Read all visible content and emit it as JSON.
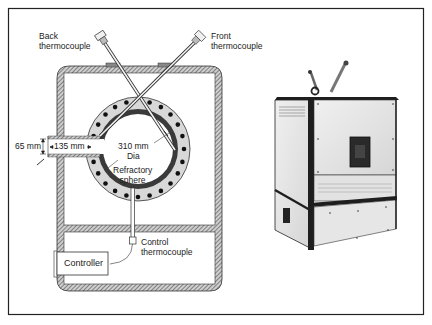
{
  "figure": {
    "type": "furnace-schematic-and-photo",
    "labels": {
      "back_thermocouple": "Back\nthermocouple",
      "front_thermocouple": "Front\nthermocouple",
      "pipe_height": "65 mm",
      "pipe_length": "135 mm",
      "sphere_diameter": "310 mm\nDia",
      "refractory_sphere": "Refractory\nsphere",
      "control_thermocouple": "Control\nthermocouple",
      "controller": "Controller"
    },
    "colors": {
      "line": "#222222",
      "hatch": "#555555",
      "refractory_fill": "#d8d8d8",
      "sphere_liner": "#3a3a3a",
      "heater_dot": "#111111",
      "photo_panel": "#e6e6e6",
      "photo_frame": "#1e1e1e"
    }
  }
}
